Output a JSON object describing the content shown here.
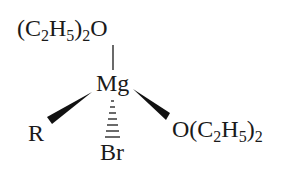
{
  "diagram": {
    "type": "chemical-structure",
    "center_atom": "Mg",
    "ligands": {
      "top": {
        "prefix": "(C",
        "sub1": "2",
        "mid": "H",
        "sub2": "5",
        "close": ")",
        "sub3": "2",
        "suffix": "O"
      },
      "left": {
        "label": "R"
      },
      "bottom": {
        "label": "Br"
      },
      "right": {
        "prefix": "O(C",
        "sub1": "2",
        "mid": "H",
        "sub2": "5",
        "close": ")",
        "sub3": "2"
      }
    },
    "bonds": [
      {
        "from": "Mg",
        "to": "O_top",
        "style": "single"
      },
      {
        "from": "Mg",
        "to": "R",
        "style": "wedge"
      },
      {
        "from": "Mg",
        "to": "O_right",
        "style": "wedge"
      },
      {
        "from": "Mg",
        "to": "Br",
        "style": "hash"
      }
    ],
    "colors": {
      "ink": "#1a1a1a",
      "background": "#ffffff"
    }
  }
}
